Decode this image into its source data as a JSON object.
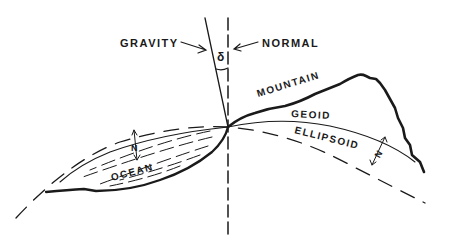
{
  "diagram": {
    "type": "geodesy-cross-section",
    "labels": {
      "gravity": "GRAVITY",
      "normal": "NORMAL",
      "deflection": "δ",
      "mountain": "MOUNTAIN",
      "geoid": "GEOID",
      "ellipsoid": "ELLIPSOID",
      "ocean": "OCEAN",
      "undulation_ocean": "N",
      "undulation_land": "N"
    },
    "colors": {
      "ink": "#1a1a1a",
      "background": "#ffffff"
    }
  }
}
